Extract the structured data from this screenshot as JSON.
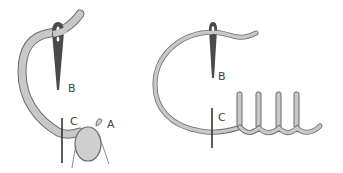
{
  "diagram": {
    "colors": {
      "background": "#ffffff",
      "thread_fill": "#c8c8c8",
      "thread_outline": "#6a6a6a",
      "needle_fill": "#4a4a4a",
      "fabric_fill": "#cfcfcf",
      "label_color": "#444444"
    },
    "panels": [
      {
        "id": "left",
        "labels": {
          "a": "A",
          "b": "B",
          "c": "C"
        }
      },
      {
        "id": "right",
        "labels": {
          "b": "B",
          "c": "C"
        },
        "completed_stitch_count": 4
      }
    ]
  }
}
